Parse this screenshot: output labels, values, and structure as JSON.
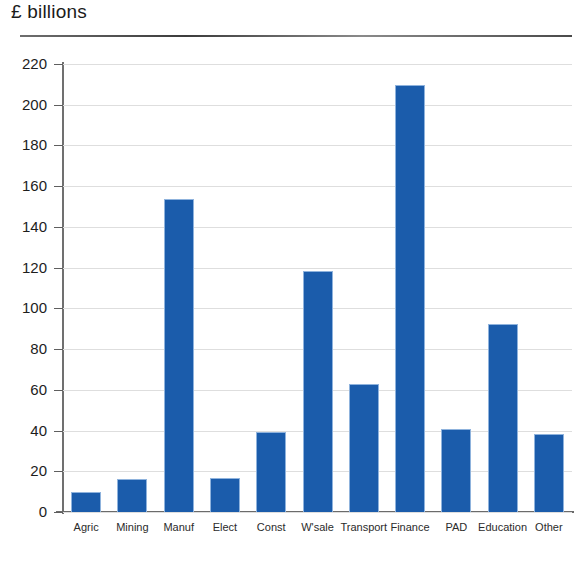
{
  "chart_data": {
    "type": "bar",
    "title": "£ billions",
    "subtitle": "",
    "xlabel": "",
    "ylabel": "£ billions",
    "categories": [
      "Agric",
      "Mining",
      "Manuf",
      "Elect",
      "Const",
      "W'sale",
      "Transport",
      "Finance",
      "PAD",
      "Education",
      "Other"
    ],
    "values": [
      10,
      16,
      153.5,
      16.5,
      39.5,
      118.5,
      63,
      209.5,
      41,
      92.5,
      38.5
    ],
    "series": [
      {
        "name": "£ billions",
        "values": [
          10,
          16,
          153.5,
          16.5,
          39.5,
          118.5,
          63,
          209.5,
          41,
          92.5,
          38.5
        ]
      }
    ],
    "ylim": [
      0,
      220
    ],
    "ytick_step": 20,
    "yticks": [
      0,
      20,
      40,
      60,
      80,
      100,
      120,
      140,
      160,
      180,
      200,
      220
    ],
    "ytick_labels": [
      "0",
      "20",
      "40",
      "60",
      "80",
      "100",
      "120",
      "140",
      "160",
      "180",
      "200",
      "220"
    ],
    "grid": true,
    "grid_axis": "y",
    "legend": false,
    "legend_position": "none",
    "bar_color": "#1b5cab",
    "grid_color": "#dedede",
    "axis_color": "#6b6b6b",
    "background_color": "#ffffff"
  },
  "header": {
    "title": "£ billions",
    "rule_color": "#4a4a4a"
  }
}
